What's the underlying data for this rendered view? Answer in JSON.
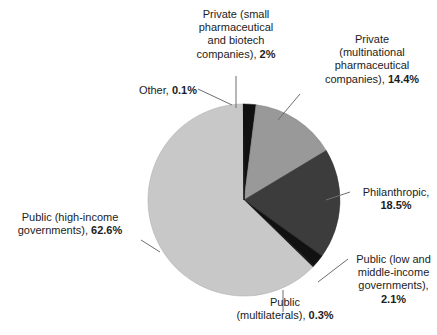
{
  "chart_data": {
    "type": "pie",
    "title": "",
    "subtitle": "",
    "xlabel": "",
    "ylabel": "",
    "legend_position": "none",
    "grid": false,
    "units": "percent",
    "total": 100,
    "start_angle_deg": 0,
    "direction": "clockwise",
    "categories": [
      "Private (small pharmaceutical and biotech companies)",
      "Private (multinational pharmaceutical companies)",
      "Philanthropic",
      "Public (low and middle-income governments)",
      "Public (multilaterals)",
      "Public (high-income governments)",
      "Other"
    ],
    "values": [
      2,
      14.4,
      18.5,
      2.1,
      0.3,
      62.6,
      0.1
    ],
    "colors": [
      "#111111",
      "#999999",
      "#3c3c3c",
      "#111111",
      "#111111",
      "#c8c8c8",
      "#111111"
    ],
    "slices": [
      {
        "name": "private-small-pharma",
        "category": "Private (small pharmaceutical and biotech companies)",
        "value": 2,
        "value_label": "2%",
        "color": "#111111"
      },
      {
        "name": "private-multinational-pharma",
        "category": "Private (multinational pharmaceutical companies)",
        "value": 14.4,
        "value_label": "14.4%",
        "color": "#999999"
      },
      {
        "name": "philanthropic",
        "category": "Philanthropic",
        "value": 18.5,
        "value_label": "18.5%",
        "color": "#3c3c3c"
      },
      {
        "name": "public-low-middle-income",
        "category": "Public (low and middle-income governments)",
        "value": 2.1,
        "value_label": "2.1%",
        "color": "#111111"
      },
      {
        "name": "public-multilaterals",
        "category": "Public (multilaterals)",
        "value": 0.3,
        "value_label": "0.3%",
        "color": "#111111"
      },
      {
        "name": "public-high-income",
        "category": "Public (high-income governments)",
        "value": 62.6,
        "value_label": "62.6%",
        "color": "#c8c8c8"
      },
      {
        "name": "other",
        "category": "Other",
        "value": 0.1,
        "value_label": "0.1%",
        "color": "#111111"
      }
    ]
  },
  "labels": {
    "private_small": {
      "line1": "Private (small",
      "line2": "pharmaceutical",
      "line3": "and biotech",
      "line4": "companies), ",
      "value": "2%"
    },
    "private_multinational": {
      "line1": "Private",
      "line2": "(multinational",
      "line3": "pharmaceutical",
      "line4": "companies), ",
      "value": "14.4%"
    },
    "other": {
      "line1": "Other, ",
      "value": "0.1%"
    },
    "philanthropic": {
      "line1": "Philanthropic,",
      "value": "18.5%"
    },
    "public_high_income": {
      "line1": "Public (high-income",
      "line2": "governments), ",
      "value": "62.6%"
    },
    "public_low_middle": {
      "line1": "Public (low and",
      "line2": "middle-income",
      "line3": "governments),",
      "value": "2.1%"
    },
    "public_multilaterals": {
      "line1": "Public",
      "line2": "(multilaterals), ",
      "value": "0.3%"
    }
  },
  "style": {
    "background": "#ffffff",
    "text_color": "#1c1c1c",
    "leader_line_color": "#6e6e6e",
    "pie_outline_color": "#8a8a8a"
  }
}
